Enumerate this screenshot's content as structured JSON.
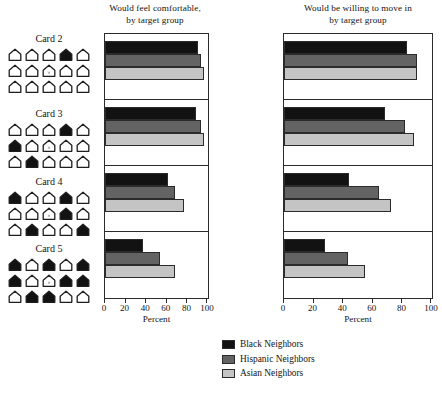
{
  "chart_data": {
    "type": "bar",
    "orientation": "horizontal",
    "panels": [
      {
        "title": "Would feel comfortable,\nby target group",
        "title_line1": "Would feel comfortable,",
        "title_line2": "by target group",
        "xlabel": "Percent",
        "xlim": [
          0,
          100
        ],
        "xticks": [
          0,
          20,
          40,
          60,
          80,
          100
        ],
        "categories": [
          "Card 2",
          "Card 3",
          "Card 4",
          "Card 5"
        ],
        "series": [
          {
            "name": "Black Neighbors",
            "color": "#121212",
            "values": [
              90,
              88,
              61,
              37
            ]
          },
          {
            "name": "Hispanic Neighbors",
            "color": "#636363",
            "values": [
              93,
              93,
              68,
              53
            ]
          },
          {
            "name": "Asian Neighbors",
            "color": "#c4c4c4",
            "values": [
              96,
              96,
              77,
              68
            ]
          }
        ]
      },
      {
        "title": "Would be willing to move in\nby target group",
        "title_line1": "Would be willing to move in",
        "title_line2": "by target group",
        "xlabel": "Percent",
        "xlim": [
          0,
          100
        ],
        "xticks": [
          0,
          20,
          40,
          60,
          80,
          100
        ],
        "categories": [
          "Card 2",
          "Card 3",
          "Card 4",
          "Card 5"
        ],
        "series": [
          {
            "name": "Black Neighbors",
            "color": "#121212",
            "values": [
              83,
              68,
              44,
              28
            ]
          },
          {
            "name": "Hispanic Neighbors",
            "color": "#636363",
            "values": [
              90,
              82,
              64,
              43
            ]
          },
          {
            "name": "Asian Neighbors",
            "color": "#c4c4c4",
            "values": [
              90,
              88,
              72,
              55
            ]
          }
        ]
      }
    ],
    "legend": {
      "position": "bottom-center",
      "entries": [
        {
          "label": "Black Neighbors",
          "color": "#121212"
        },
        {
          "label": "Hispanic Neighbors",
          "color": "#636363"
        },
        {
          "label": "Asian Neighbors",
          "color": "#c4c4c4"
        }
      ]
    },
    "grid": false
  },
  "cards": [
    {
      "label": "Card 2",
      "rows": [
        [
          "open",
          "open",
          "open",
          "filled",
          "open"
        ],
        [
          "open",
          "open",
          "self",
          "open",
          "open"
        ],
        [
          "open",
          "open",
          "open",
          "open",
          "open"
        ]
      ]
    },
    {
      "label": "Card 3",
      "rows": [
        [
          "open",
          "open",
          "open",
          "filled",
          "open"
        ],
        [
          "filled",
          "open",
          "self",
          "open",
          "open"
        ],
        [
          "open",
          "filled",
          "open",
          "open",
          "open"
        ]
      ]
    },
    {
      "label": "Card 4",
      "rows": [
        [
          "filled",
          "open",
          "open",
          "filled",
          "open"
        ],
        [
          "open",
          "open",
          "self",
          "filled",
          "open"
        ],
        [
          "open",
          "filled",
          "open",
          "open",
          "filled"
        ]
      ]
    },
    {
      "label": "Card 5",
      "rows": [
        [
          "filled",
          "open",
          "filled",
          "open",
          "filled"
        ],
        [
          "filled",
          "open",
          "self",
          "filled",
          "filled"
        ],
        [
          "open",
          "filled",
          "filled",
          "open",
          "open"
        ]
      ]
    }
  ],
  "icons": {
    "house_open": "house-outline-icon",
    "house_filled": "house-filled-icon",
    "house_self": "house-self-marker-icon"
  }
}
